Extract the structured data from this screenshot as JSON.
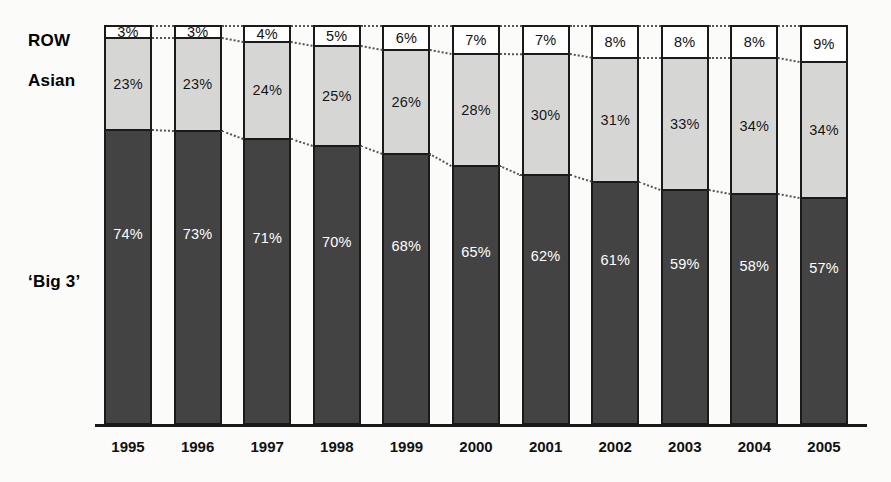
{
  "chart_data": {
    "type": "bar",
    "subtype": "stacked-100-percent",
    "title": "",
    "xlabel": "",
    "ylabel": "",
    "ylim": [
      0,
      100
    ],
    "grid": false,
    "legend_position": "left-inline-labels",
    "orientation": "vertical",
    "stack_order_top_to_bottom": [
      "ROW",
      "Asian",
      "'Big 3'"
    ],
    "categories": [
      "1995",
      "1996",
      "1997",
      "1998",
      "1999",
      "2000",
      "2001",
      "2002",
      "2003",
      "2004",
      "2005"
    ],
    "series": [
      {
        "name": "'Big 3'",
        "color": "#434343",
        "values": [
          74,
          73,
          71,
          70,
          68,
          65,
          62,
          61,
          59,
          58,
          57
        ],
        "labels": [
          "74%",
          "73%",
          "71%",
          "70%",
          "68%",
          "65%",
          "62%",
          "61%",
          "59%",
          "58%",
          "57%"
        ]
      },
      {
        "name": "Asian",
        "color": "#d6d6d4",
        "values": [
          23,
          23,
          24,
          25,
          26,
          28,
          30,
          31,
          33,
          34,
          34
        ],
        "labels": [
          "23%",
          "23%",
          "24%",
          "25%",
          "26%",
          "28%",
          "30%",
          "31%",
          "33%",
          "34%",
          "34%"
        ]
      },
      {
        "name": "ROW",
        "color": "#ffffff",
        "values": [
          3,
          3,
          4,
          5,
          6,
          7,
          7,
          8,
          8,
          8,
          9
        ],
        "labels": [
          "3%",
          "3%",
          "4%",
          "5%",
          "6%",
          "7%",
          "7%",
          "8%",
          "8%",
          "8%",
          "9%"
        ]
      }
    ]
  },
  "labels": {
    "row": "ROW",
    "asian": "Asian",
    "big3": "‘Big 3’"
  },
  "colors": {
    "big3": "#434343",
    "asian": "#d6d6d4",
    "row": "#ffffff",
    "outline": "#1a1a1a",
    "connector": "#555555",
    "background": "#fbfbfa"
  }
}
